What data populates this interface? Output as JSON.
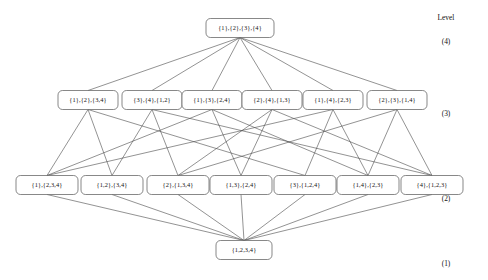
{
  "figure": {
    "type": "hasse-diagram",
    "level_header": "Level",
    "colors": {
      "background": "#ffffff",
      "node_stroke": "#555555",
      "node_fill": "#ffffff",
      "edge": "#4a4a4a",
      "text": "#111111"
    }
  },
  "levels": [
    {
      "id": "L4",
      "label": "(4)",
      "y": 28,
      "block_count": 4
    },
    {
      "id": "L3",
      "label": "(3)",
      "y": 100,
      "block_count": 3
    },
    {
      "id": "L2",
      "label": "(2)",
      "y": 185,
      "block_count": 2
    },
    {
      "id": "L1",
      "label": "(1)",
      "y": 250,
      "block_count": 1
    }
  ],
  "nodes": [
    {
      "id": "n0",
      "label": "{1},{2},{3},{4}",
      "level": "L4",
      "cx": 240,
      "cy": 28,
      "w": 68,
      "h": 19
    },
    {
      "id": "a1",
      "label": "{1},{2},{3,4}",
      "level": "L3",
      "cx": 88,
      "cy": 100,
      "w": 60,
      "h": 19
    },
    {
      "id": "a2",
      "label": "{3},{4},{1,2}",
      "level": "L3",
      "cx": 152,
      "cy": 100,
      "w": 60,
      "h": 19
    },
    {
      "id": "a3",
      "label": "{1},{3},{2,4}",
      "level": "L3",
      "cx": 212,
      "cy": 100,
      "w": 60,
      "h": 19
    },
    {
      "id": "a4",
      "label": "{2},{4},{1,3}",
      "level": "L3",
      "cx": 272,
      "cy": 100,
      "w": 60,
      "h": 19
    },
    {
      "id": "a5",
      "label": "{1},{4},{2,3}",
      "level": "L3",
      "cx": 333,
      "cy": 100,
      "w": 60,
      "h": 19
    },
    {
      "id": "a6",
      "label": "{2},{3},{1,4}",
      "level": "L3",
      "cx": 397,
      "cy": 100,
      "w": 60,
      "h": 19
    },
    {
      "id": "b1",
      "label": "{1},{2,3,4}",
      "level": "L2",
      "cx": 47,
      "cy": 185,
      "w": 62,
      "h": 19
    },
    {
      "id": "b2",
      "label": "{1,2},{3,4}",
      "level": "L2",
      "cx": 112,
      "cy": 185,
      "w": 62,
      "h": 19
    },
    {
      "id": "b3",
      "label": "{2},{1,3,4}",
      "level": "L2",
      "cx": 178,
      "cy": 185,
      "w": 62,
      "h": 19
    },
    {
      "id": "b4",
      "label": "{1,3},{2,4}",
      "level": "L2",
      "cx": 241,
      "cy": 185,
      "w": 62,
      "h": 19
    },
    {
      "id": "b5",
      "label": "{3},{1,2,4}",
      "level": "L2",
      "cx": 305,
      "cy": 185,
      "w": 62,
      "h": 19
    },
    {
      "id": "b6",
      "label": "{1,4},{2,3}",
      "level": "L2",
      "cx": 368,
      "cy": 185,
      "w": 62,
      "h": 19
    },
    {
      "id": "b7",
      "label": "{4},{1,2,3}",
      "level": "L2",
      "cx": 432,
      "cy": 185,
      "w": 62,
      "h": 19
    },
    {
      "id": "c1",
      "label": "{1,2,3,4}",
      "level": "L1",
      "cx": 244,
      "cy": 250,
      "w": 56,
      "h": 19
    }
  ],
  "edges": [
    {
      "from": "n0",
      "to": "a1"
    },
    {
      "from": "n0",
      "to": "a2"
    },
    {
      "from": "n0",
      "to": "a3"
    },
    {
      "from": "n0",
      "to": "a4"
    },
    {
      "from": "n0",
      "to": "a5"
    },
    {
      "from": "n0",
      "to": "a6"
    },
    {
      "from": "a1",
      "to": "b1"
    },
    {
      "from": "a1",
      "to": "b2"
    },
    {
      "from": "a1",
      "to": "b5"
    },
    {
      "from": "a2",
      "to": "b2"
    },
    {
      "from": "a2",
      "to": "b3"
    },
    {
      "from": "a2",
      "to": "b7"
    },
    {
      "from": "a3",
      "to": "b1"
    },
    {
      "from": "a3",
      "to": "b4"
    },
    {
      "from": "a3",
      "to": "b6"
    },
    {
      "from": "a4",
      "to": "b3"
    },
    {
      "from": "a4",
      "to": "b4"
    },
    {
      "from": "a4",
      "to": "b7"
    },
    {
      "from": "a5",
      "to": "b1"
    },
    {
      "from": "a5",
      "to": "b5"
    },
    {
      "from": "a5",
      "to": "b6"
    },
    {
      "from": "a6",
      "to": "b3"
    },
    {
      "from": "a6",
      "to": "b6"
    },
    {
      "from": "a6",
      "to": "b7"
    },
    {
      "from": "b1",
      "to": "c1"
    },
    {
      "from": "b2",
      "to": "c1"
    },
    {
      "from": "b3",
      "to": "c1"
    },
    {
      "from": "b4",
      "to": "c1"
    },
    {
      "from": "b5",
      "to": "c1"
    },
    {
      "from": "b6",
      "to": "c1"
    },
    {
      "from": "b7",
      "to": "c1"
    }
  ],
  "level_header_pos": {
    "x": 446,
    "y": 20
  },
  "level_label_x": 446
}
